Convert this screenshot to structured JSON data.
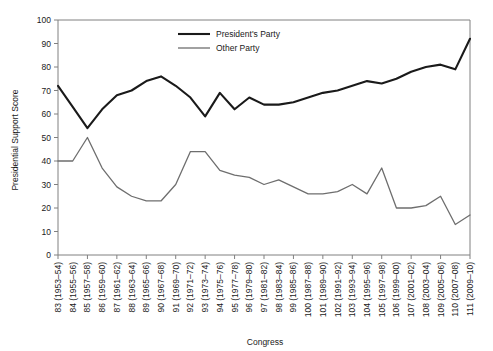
{
  "chart_data": {
    "type": "line",
    "title": "",
    "xlabel": "Congress",
    "ylabel": "Presidential Support Score",
    "ylim": [
      0,
      100
    ],
    "ytick_step": 10,
    "yticks": [
      0,
      10,
      20,
      30,
      40,
      50,
      60,
      70,
      80,
      90,
      100
    ],
    "grid": false,
    "legend_position": "top-center",
    "categories": [
      "83 (1953–54)",
      "84 (1955–56)",
      "85 (1957–58)",
      "86 (1959–60)",
      "87 (1961–62)",
      "88 (1963–64)",
      "89 (1965–66)",
      "90 (1967–68)",
      "91 (1969–70)",
      "92 (1971–72)",
      "93 (1973–74)",
      "94 (1975–76)",
      "95 (1977–78)",
      "96 (1979–80)",
      "97 (1981–82)",
      "98 (1983–84)",
      "99 (1985–86)",
      "100 (1987–88)",
      "101 (1989–90)",
      "102 (1991–92)",
      "103 (1993–94)",
      "104 (1995–96)",
      "105 (1997–98)",
      "106 (1999–00)",
      "107 (2001–02)",
      "108 (2003–04)",
      "109 (2005–06)",
      "110 (2007–08)",
      "111 (2009–10)"
    ],
    "series": [
      {
        "name": "President's  Party",
        "color": "#1a1a1a",
        "width": 2.1,
        "values": [
          72,
          63,
          54,
          62,
          68,
          70,
          74,
          76,
          72,
          67,
          59,
          69,
          62,
          67,
          64,
          64,
          65,
          67,
          69,
          70,
          72,
          74,
          73,
          75,
          78,
          80,
          81,
          79,
          92
        ]
      },
      {
        "name": "Other Party",
        "color": "#6e6e6e",
        "width": 1.3,
        "values": [
          40,
          40,
          50,
          37,
          29,
          25,
          23,
          23,
          30,
          44,
          44,
          36,
          34,
          33,
          30,
          32,
          29,
          26,
          26,
          27,
          30,
          26,
          37,
          20,
          20,
          21,
          25,
          13,
          17
        ]
      }
    ]
  },
  "axes": {
    "y_title": "Presidential Support Score",
    "x_title": "Congress"
  },
  "legend": {
    "entries": [
      {
        "label": "President's  Party",
        "color": "#1a1a1a",
        "width": 2.1
      },
      {
        "label": "Other Party",
        "color": "#6e6e6e",
        "width": 1.3
      }
    ]
  }
}
